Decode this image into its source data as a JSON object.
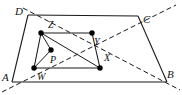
{
  "figure": {
    "kind": "geometry-diagram",
    "width": 182,
    "height": 95,
    "background_color": "#ffffff",
    "stroke_color": "#1a1a1a",
    "dash_color": "#1a1a1a",
    "dot_color": "#000000",
    "dot_radius": 2.6,
    "solid_stroke_width": 1.1,
    "dash_stroke_width": 1.0,
    "dash_pattern": "5,3"
  },
  "labels": {
    "A": "A",
    "B": "B",
    "C": "C",
    "D": "D",
    "W": "W",
    "X": "X",
    "Y": "Y",
    "Z": "Z",
    "P": "P"
  },
  "points": {
    "A": {
      "x": 12,
      "y": 82,
      "label": "A",
      "label_x": 3,
      "label_y": 74,
      "marked": false
    },
    "B": {
      "x": 167,
      "y": 82,
      "label": "B",
      "label_x": 167,
      "label_y": 70,
      "marked": false
    },
    "C": {
      "x": 138,
      "y": 16,
      "label": "C",
      "label_x": 143,
      "label_y": 15,
      "marked": false
    },
    "D": {
      "x": 28,
      "y": 15,
      "label": "D",
      "label_x": 16,
      "label_y": 7,
      "marked": false
    },
    "W": {
      "x": 34,
      "y": 68,
      "label": "W",
      "label_x": 36,
      "label_y": 71,
      "marked": true
    },
    "X": {
      "x": 100,
      "y": 68,
      "label": "X",
      "label_x": 103,
      "label_y": 53,
      "marked": true
    },
    "Y": {
      "x": 92,
      "y": 33,
      "label": "Y",
      "label_x": 94,
      "label_y": 37,
      "marked": true
    },
    "Z": {
      "x": 41,
      "y": 33,
      "label": "Z",
      "label_x": 47,
      "label_y": 19,
      "marked": true
    },
    "P": {
      "x": 51,
      "y": 50,
      "label": "P",
      "label_x": 50,
      "label_y": 53,
      "marked": true
    }
  },
  "solid_segments": [
    {
      "name": "side-AB",
      "from": "A",
      "to": "B"
    },
    {
      "name": "side-BC",
      "from": "B",
      "to": "C"
    },
    {
      "name": "side-CD",
      "from": "C",
      "to": "D"
    },
    {
      "name": "side-DA",
      "from": "D",
      "to": "A"
    },
    {
      "name": "side-WX",
      "from": "W",
      "to": "X"
    },
    {
      "name": "side-XY",
      "from": "X",
      "to": "Y"
    },
    {
      "name": "side-YZ",
      "from": "Y",
      "to": "Z"
    },
    {
      "name": "side-ZW",
      "from": "W",
      "to": "Z"
    }
  ],
  "dashed_lines": [
    {
      "name": "diagonal-A-Z-Y-C-extended",
      "x1": 2,
      "y1": 92,
      "x2": 176,
      "y2": 5,
      "through": [
        "A",
        "Z",
        "Y",
        "C"
      ]
    },
    {
      "name": "diagonal-D-P-X-B-extended",
      "x1": 23,
      "y1": 8,
      "x2": 180,
      "y2": 90,
      "through": [
        "D",
        "P",
        "X",
        "B"
      ]
    }
  ],
  "dashed_short_segments": [
    {
      "name": "segment-P-Z",
      "from": "P",
      "to": "Z"
    },
    {
      "name": "segment-P-W",
      "from": "P",
      "to": "W"
    },
    {
      "name": "segment-P-Y",
      "from": "P",
      "to": "Y"
    }
  ],
  "solid_inner_spokes": [
    {
      "name": "segment-Z-P",
      "from": "Z",
      "to": "P"
    },
    {
      "name": "segment-W-P",
      "from": "W",
      "to": "P"
    },
    {
      "name": "segment-Z-Y",
      "from": "Z",
      "to": "Y"
    }
  ]
}
